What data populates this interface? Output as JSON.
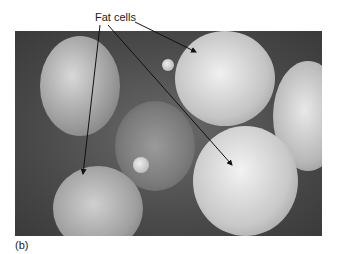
{
  "figure": {
    "label": "(b)",
    "annotation": "Fat cells",
    "image_description": "Scanning electron micrograph of fat cells (adipocytes) surrounded by connective tissue fibers",
    "arrows": [
      {
        "from": [
          100,
          25
        ],
        "to": [
          83,
          174
        ]
      },
      {
        "from": [
          108,
          25
        ],
        "to": [
          232,
          165
        ]
      },
      {
        "from": [
          135,
          22
        ],
        "to": [
          196,
          52
        ]
      }
    ]
  }
}
